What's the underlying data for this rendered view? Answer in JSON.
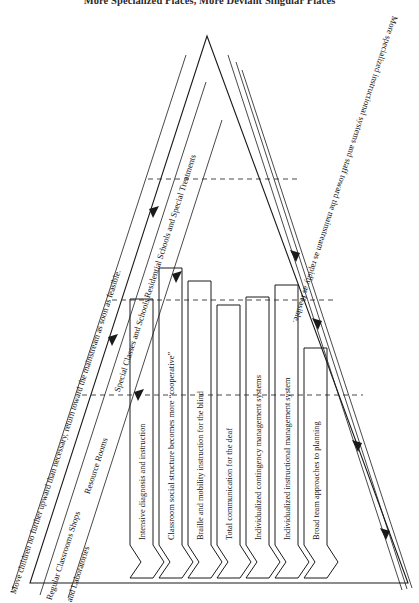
{
  "figure": {
    "title": "More Specialized Places, More Deviant Singular Places",
    "type": "cascade-triangle-diagram",
    "orientation": "rotated-90"
  },
  "left_side": {
    "flow_label": "Move children no further upward than necessary, return toward the mainstream as soon as feasible.",
    "tier_labels": [
      "Regular Classrooms  Shops\nand Laboratories",
      "Resource Rooms",
      "Special Classes and Schools",
      "Residential Schools and Special Treatments"
    ],
    "tier_1a": "Regular Classrooms  Shops",
    "tier_1b": "and Laboratories",
    "tier_2": "Resource Rooms",
    "tier_3": "Special Classes and Schools",
    "tier_4": "Residential Schools and Special Treatments"
  },
  "right_side": {
    "flow_label": "More specialized instructional systems and staff toward the mainstream as rapidly as feasible."
  },
  "columns": [
    {
      "id": "col-1",
      "label": "Intensive diagnosis and instruction"
    },
    {
      "id": "col-2",
      "label": "Classroom social structure becomes more “cooperative”"
    },
    {
      "id": "col-3",
      "label": "Braille and mobility instruction for the blind"
    },
    {
      "id": "col-4",
      "label": "Total communication for the deaf"
    },
    {
      "id": "col-5",
      "label": "Individualized contingency management systems"
    },
    {
      "id": "col-6",
      "label": "Individualized instructional management system"
    },
    {
      "id": "col-7",
      "label": "Broad team approaches to planning"
    }
  ],
  "style": {
    "stroke": "#1a1a1a",
    "background": "#ffffff",
    "dash_stroke": "#333333"
  }
}
